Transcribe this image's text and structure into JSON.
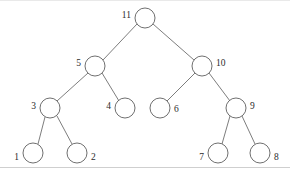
{
  "diagram": {
    "type": "binary-tree",
    "canvas": {
      "width": 290,
      "height": 172
    },
    "style": {
      "node_radius": 10,
      "node_fill": "#ffffff",
      "node_stroke": "#5f5f5f",
      "edge_stroke": "#6e6e6e",
      "label_color": "#2b2b2b",
      "background": "#ffffff",
      "border_color": "#cfcfcf"
    },
    "nodes": [
      {
        "id": "n11",
        "label": "11",
        "cx": 145,
        "cy": 18,
        "label_side": "left",
        "lx": 131,
        "ly": 14,
        "depth": 0
      },
      {
        "id": "n5",
        "label": "5",
        "cx": 95,
        "cy": 66,
        "label_side": "left",
        "lx": 81,
        "ly": 62,
        "depth": 1
      },
      {
        "id": "n10",
        "label": "10",
        "cx": 202,
        "cy": 66,
        "label_side": "right",
        "lx": 216,
        "ly": 62,
        "depth": 1
      },
      {
        "id": "n3",
        "label": "3",
        "cx": 50,
        "cy": 108,
        "label_side": "left",
        "lx": 36,
        "ly": 105,
        "depth": 2
      },
      {
        "id": "n4",
        "label": "4",
        "cx": 125,
        "cy": 108,
        "label_side": "left",
        "lx": 111,
        "ly": 105,
        "depth": 2
      },
      {
        "id": "n6",
        "label": "6",
        "cx": 160,
        "cy": 108,
        "label_side": "right",
        "lx": 174,
        "ly": 108,
        "depth": 2
      },
      {
        "id": "n9",
        "label": "9",
        "cx": 236,
        "cy": 108,
        "label_side": "right",
        "lx": 250,
        "ly": 105,
        "depth": 2
      },
      {
        "id": "n1",
        "label": "1",
        "cx": 33,
        "cy": 153,
        "label_side": "left",
        "lx": 19,
        "ly": 156,
        "depth": 3
      },
      {
        "id": "n2",
        "label": "2",
        "cx": 77,
        "cy": 153,
        "label_side": "right",
        "lx": 91,
        "ly": 156,
        "depth": 3
      },
      {
        "id": "n7",
        "label": "7",
        "cx": 218,
        "cy": 153,
        "label_side": "left",
        "lx": 204,
        "ly": 156,
        "depth": 3
      },
      {
        "id": "n8",
        "label": "8",
        "cx": 260,
        "cy": 153,
        "label_side": "right",
        "lx": 274,
        "ly": 156,
        "depth": 3
      }
    ],
    "edges": [
      {
        "from": "n11",
        "to": "n5",
        "x1": 137,
        "y1": 24,
        "x2": 103,
        "y2": 60
      },
      {
        "from": "n11",
        "to": "n10",
        "x1": 153,
        "y1": 24,
        "x2": 194,
        "y2": 60
      },
      {
        "from": "n5",
        "to": "n3",
        "x1": 88,
        "y1": 73,
        "x2": 57,
        "y2": 101
      },
      {
        "from": "n5",
        "to": "n4",
        "x1": 102,
        "y1": 73,
        "x2": 119,
        "y2": 101
      },
      {
        "from": "n10",
        "to": "n6",
        "x1": 195,
        "y1": 73,
        "x2": 167,
        "y2": 101
      },
      {
        "from": "n10",
        "to": "n9",
        "x1": 209,
        "y1": 73,
        "x2": 230,
        "y2": 101
      },
      {
        "from": "n3",
        "to": "n1",
        "x1": 45,
        "y1": 117,
        "x2": 38,
        "y2": 144
      },
      {
        "from": "n3",
        "to": "n2",
        "x1": 57,
        "y1": 116,
        "x2": 72,
        "y2": 144
      },
      {
        "from": "n9",
        "to": "n7",
        "x1": 230,
        "y1": 116,
        "x2": 222,
        "y2": 144
      },
      {
        "from": "n9",
        "to": "n8",
        "x1": 242,
        "y1": 116,
        "x2": 255,
        "y2": 144
      }
    ]
  }
}
